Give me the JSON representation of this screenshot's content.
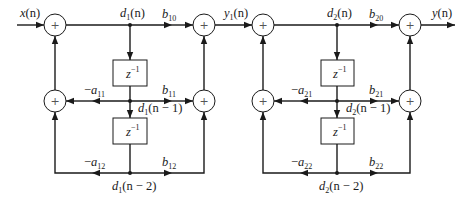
{
  "diagram": {
    "colors": {
      "line": "#1a1a1a",
      "background": "#ffffff"
    },
    "adder_symbol": "+",
    "delay_symbol": {
      "base": "z",
      "exponent": "−1"
    },
    "input_label": {
      "var": "x",
      "arg": "(n)"
    },
    "output_label": {
      "var": "y",
      "arg": "(n)"
    },
    "intermediate_label": {
      "var": "y",
      "sub": "1",
      "arg": "(n)"
    },
    "sections": [
      {
        "id": 1,
        "node_d0": {
          "var": "d",
          "sub": "1",
          "arg": "(n)"
        },
        "node_d1": {
          "var": "d",
          "sub": "1",
          "arg": "(n − 1)"
        },
        "node_d2": {
          "var": "d",
          "sub": "1",
          "arg": "(n − 2)"
        },
        "b0": {
          "var": "b",
          "sub": "10"
        },
        "b1": {
          "var": "b",
          "sub": "11"
        },
        "b2": {
          "var": "b",
          "sub": "12"
        },
        "a1": {
          "sign": "−",
          "var": "a",
          "sub": "11"
        },
        "a2": {
          "sign": "−",
          "var": "a",
          "sub": "12"
        }
      },
      {
        "id": 2,
        "node_d0": {
          "var": "d",
          "sub": "2",
          "arg": "(n)"
        },
        "node_d1": {
          "var": "d",
          "sub": "2",
          "arg": "(n − 1)"
        },
        "node_d2": {
          "var": "d",
          "sub": "2",
          "arg": "(n − 2)"
        },
        "b0": {
          "var": "b",
          "sub": "20"
        },
        "b1": {
          "var": "b",
          "sub": "21"
        },
        "b2": {
          "var": "b",
          "sub": "22"
        },
        "a1": {
          "sign": "−",
          "var": "a",
          "sub": "21"
        },
        "a2": {
          "sign": "−",
          "var": "a",
          "sub": "22"
        }
      }
    ]
  }
}
